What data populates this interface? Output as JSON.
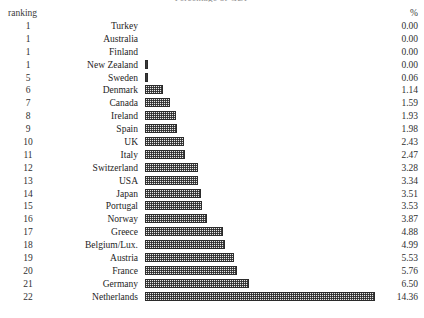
{
  "chart_data": {
    "type": "bar",
    "orientation": "horizontal",
    "title": "Percentage of GDP",
    "xlabel": "",
    "ylabel": "",
    "xlim": [
      0,
      14.36
    ],
    "grid": false,
    "legend": null,
    "columns": [
      "ranking",
      "country",
      "%"
    ],
    "categories": [
      "Turkey",
      "Australia",
      "Finland",
      "New Zealand",
      "Sweden",
      "Denmark",
      "Canada",
      "Ireland",
      "Spain",
      "UK",
      "Italy",
      "Switzerland",
      "USA",
      "Japan",
      "Portugal",
      "Norway",
      "Greece",
      "Belgium/Lux.",
      "Austria",
      "France",
      "Germany",
      "Netherlands"
    ],
    "values": [
      0.0,
      0.0,
      0.0,
      0.0,
      0.06,
      1.14,
      1.59,
      1.93,
      1.98,
      2.43,
      2.47,
      3.28,
      3.34,
      3.51,
      3.53,
      3.87,
      4.88,
      4.99,
      5.53,
      5.76,
      6.5,
      14.36
    ],
    "ranks": [
      "1",
      "1",
      "1",
      "1",
      "5",
      "6",
      "7",
      "8",
      "9",
      "10",
      "11",
      "12",
      "13",
      "14",
      "15",
      "16",
      "17",
      "18",
      "19",
      "20",
      "21",
      "22"
    ],
    "value_labels": [
      "0.00",
      "0.00",
      "0.00",
      "0.00",
      "0.06",
      "1.14",
      "1.59",
      "1.93",
      "1.98",
      "2.43",
      "2.47",
      "3.28",
      "3.34",
      "3.51",
      "3.53",
      "3.87",
      "4.88",
      "4.99",
      "5.53",
      "5.76",
      "6.50",
      "14.36"
    ]
  },
  "header": {
    "ranking_label": "ranking",
    "percent_label": "%"
  },
  "colors": {
    "background": "#ffffff",
    "text": "#2a2a2a",
    "bar_outline": "#2b2b2b",
    "bar_fill": "#e9e9e9"
  }
}
